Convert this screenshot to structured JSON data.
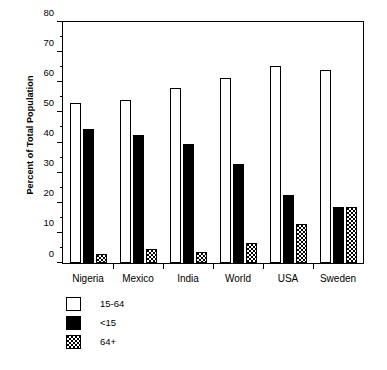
{
  "chart_data": {
    "type": "bar",
    "title": "",
    "subtitle": "",
    "xlabel": "",
    "ylabel": "Percent of Total Population",
    "categories": [
      "Nigeria",
      "Mexico",
      "India",
      "World",
      "USA",
      "Sweden"
    ],
    "series": [
      {
        "name": "15-64",
        "values": [
          53,
          54,
          58,
          61.5,
          65.5,
          64
        ],
        "fill": "white",
        "swatch": "open-square"
      },
      {
        "name": "<15",
        "values": [
          44.5,
          42.5,
          39.5,
          33,
          22.5,
          18.5
        ],
        "fill": "black",
        "swatch": "filled-square"
      },
      {
        "name": "64+",
        "values": [
          3,
          4.5,
          3.5,
          6.5,
          13,
          18.5
        ],
        "fill": "stippled",
        "swatch": "dotted-square"
      }
    ],
    "ylim": [
      0,
      80
    ],
    "ytick_major": [
      0,
      10,
      20,
      30,
      40,
      50,
      60,
      70,
      80
    ],
    "ytick_minor": [
      5,
      15,
      25,
      35,
      45,
      55,
      65,
      75
    ],
    "ytick_labels": [
      "0",
      "10",
      "20",
      "30",
      "40",
      "50",
      "60",
      "70",
      "80"
    ],
    "grid": false,
    "legend_position": "below-left",
    "legend_entries": [
      "15-64",
      "<15",
      "64+"
    ],
    "colors": {
      "axis": "#000000",
      "series_15_64": "#ffffff",
      "series_lt15": "#000000",
      "series_64plus": "#ffffff",
      "background": "#ffffff"
    }
  }
}
